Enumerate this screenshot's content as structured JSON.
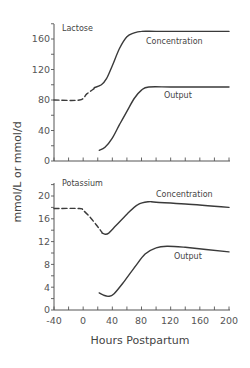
{
  "chart_data": [
    {
      "type": "line",
      "panel": "Lactose",
      "title": "Lactose",
      "xlabel": "Hours Postpartum",
      "ylabel": "mmol/L or mmol/d",
      "xlim": [
        -40,
        200
      ],
      "ylim": [
        0,
        180
      ],
      "xticks": [
        -40,
        0,
        40,
        80,
        120,
        160,
        200
      ],
      "yticks": [
        0,
        40,
        80,
        120,
        160
      ],
      "grid": false,
      "series": [
        {
          "name": "Concentration",
          "style": "dashed",
          "x": [
            -40,
            -5,
            5,
            15
          ],
          "y": [
            80,
            80,
            88,
            95
          ]
        },
        {
          "name": "Concentration",
          "style": "solid",
          "x": [
            15,
            25,
            32,
            40,
            50,
            60,
            70,
            80,
            100,
            140,
            200
          ],
          "y": [
            96,
            100,
            108,
            125,
            148,
            163,
            168,
            170,
            170,
            170,
            170
          ]
        },
        {
          "name": "Output",
          "style": "solid",
          "x": [
            22,
            30,
            40,
            50,
            60,
            70,
            80,
            90,
            120,
            160,
            200
          ],
          "y": [
            14,
            18,
            30,
            48,
            65,
            82,
            93,
            97,
            97,
            97,
            97
          ]
        }
      ],
      "annotations": [
        {
          "text": "Lactose",
          "x": -30,
          "y": 172
        },
        {
          "text": "Concentration",
          "x": 100,
          "y": 155
        },
        {
          "text": "Output",
          "x": 88,
          "y": 86
        }
      ]
    },
    {
      "type": "line",
      "panel": "Potassium",
      "title": "Potassium",
      "xlabel": "Hours Postpartum",
      "ylabel": "mmol/L or mmol/d",
      "xlim": [
        -40,
        200
      ],
      "ylim": [
        0,
        22.5
      ],
      "xticks": [
        -40,
        0,
        40,
        80,
        120,
        160,
        200
      ],
      "yticks": [
        0,
        4,
        8,
        12,
        16,
        20
      ],
      "grid": false,
      "series": [
        {
          "name": "Concentration",
          "style": "dashed",
          "x": [
            -40,
            -5,
            0,
            10,
            20,
            26
          ],
          "y": [
            17.8,
            17.8,
            17.5,
            16.2,
            14.6,
            13.6
          ]
        },
        {
          "name": "Concentration",
          "style": "solid",
          "x": [
            26,
            30,
            35,
            45,
            60,
            75,
            90,
            100,
            140,
            200
          ],
          "y": [
            13.5,
            13.3,
            13.5,
            14.8,
            16.8,
            18.5,
            19.0,
            18.9,
            18.6,
            18.0
          ]
        },
        {
          "name": "Output",
          "style": "solid",
          "x": [
            22,
            28,
            35,
            42,
            55,
            70,
            85,
            100,
            115,
            140,
            200
          ],
          "y": [
            3.0,
            2.6,
            2.4,
            2.8,
            4.8,
            7.4,
            9.8,
            10.9,
            11.2,
            11.0,
            10.2
          ]
        }
      ],
      "annotations": [
        {
          "text": "Potassium",
          "x": -30,
          "y": 21.5
        },
        {
          "text": "Concentration",
          "x": 100,
          "y": 20.0
        },
        {
          "text": "Output",
          "x": 104,
          "y": 9.4
        }
      ]
    }
  ],
  "labels": {
    "lactose": "Lactose",
    "potassium": "Potassium",
    "concentration": "Concentration",
    "output": "Output",
    "ylabel": "mmol/L or mmol/d",
    "xlabel": "Hours Postpartum"
  },
  "top_ticks": {
    "y": [
      "0",
      "40",
      "80",
      "120",
      "160"
    ]
  },
  "bottom_ticks": {
    "y": [
      "0",
      "4",
      "8",
      "12",
      "16",
      "20"
    ],
    "x": [
      "-40",
      "0",
      "40",
      "80",
      "120",
      "160",
      "200"
    ]
  }
}
